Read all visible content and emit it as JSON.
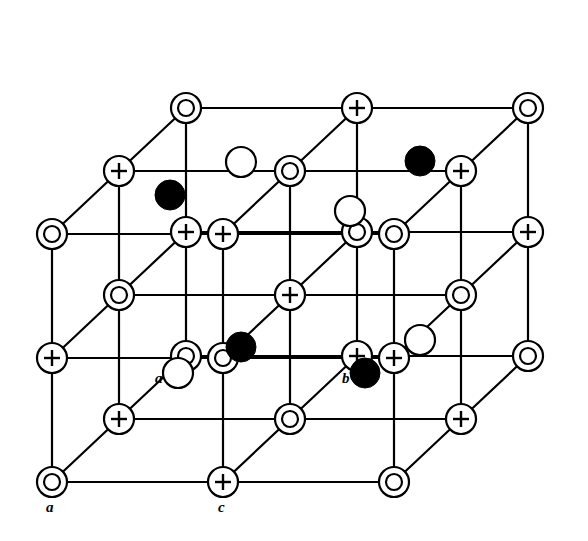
{
  "figure": {
    "background_color": "#ffffff",
    "line_color": "#000000",
    "fill_open": "#ffffff",
    "fill_solid": "#000000",
    "stroke_width": 2.2
  },
  "legend_symbols": [
    {
      "name": "double-circle-site",
      "glyph": "concentric-circles",
      "meaning": "anion lattice site",
      "outer_radius": 15,
      "inner_radius": 8
    },
    {
      "name": "plus-circle-site",
      "glyph": "circle-with-plus",
      "meaning": "cation lattice site",
      "radius": 15
    },
    {
      "name": "open-circle-atom",
      "glyph": "plain-open-circle",
      "meaning": "interstitial atom, front layer",
      "radius": 15
    },
    {
      "name": "filled-circle-atom",
      "glyph": "solid-black-circle",
      "meaning": "interstitial atom, rear layer",
      "radius": 15
    }
  ],
  "labels": [
    {
      "id": "axis-a",
      "text": "a",
      "x": 46,
      "y": 500
    },
    {
      "id": "axis-c",
      "text": "c",
      "x": 218,
      "y": 500
    },
    {
      "id": "site-a",
      "text": "a",
      "x": 155,
      "y": 371
    },
    {
      "id": "site-b",
      "text": "b",
      "x": 342,
      "y": 371
    }
  ],
  "geometry": {
    "note": "Oblique projection. Front face grid uses x-step and y-step; depth offset shifts up-right.",
    "front_origin_x": 52,
    "front_origin_y": 482,
    "x_step": 171,
    "y_step": 124,
    "depth_dx": 67,
    "depth_dy": -63,
    "layers": 3,
    "cols": 3,
    "rows": 3
  },
  "lattice_sites": [
    {
      "id": "L0-r0-c0",
      "type": "double-circle-site",
      "x": 52,
      "y": 482
    },
    {
      "id": "L0-r0-c1",
      "type": "plus-circle-site",
      "x": 223,
      "y": 482
    },
    {
      "id": "L0-r0-c2",
      "type": "double-circle-site",
      "x": 394,
      "y": 482
    },
    {
      "id": "L0-r1-c0",
      "type": "plus-circle-site",
      "x": 52,
      "y": 358
    },
    {
      "id": "L0-r1-c1",
      "type": "double-circle-site",
      "x": 223,
      "y": 358
    },
    {
      "id": "L0-r1-c2",
      "type": "plus-circle-site",
      "x": 394,
      "y": 358
    },
    {
      "id": "L0-r2-c0",
      "type": "double-circle-site",
      "x": 52,
      "y": 234
    },
    {
      "id": "L0-r2-c1",
      "type": "plus-circle-site",
      "x": 223,
      "y": 234
    },
    {
      "id": "L0-r2-c2",
      "type": "double-circle-site",
      "x": 394,
      "y": 234
    },
    {
      "id": "L1-r0-c0",
      "type": "plus-circle-site",
      "x": 119,
      "y": 419
    },
    {
      "id": "L1-r0-c1",
      "type": "double-circle-site",
      "x": 290,
      "y": 419
    },
    {
      "id": "L1-r0-c2",
      "type": "plus-circle-site",
      "x": 461,
      "y": 419
    },
    {
      "id": "L1-r1-c0",
      "type": "double-circle-site",
      "x": 119,
      "y": 295
    },
    {
      "id": "L1-r1-c1",
      "type": "plus-circle-site",
      "x": 290,
      "y": 295
    },
    {
      "id": "L1-r1-c2",
      "type": "double-circle-site",
      "x": 461,
      "y": 295
    },
    {
      "id": "L1-r2-c0",
      "type": "plus-circle-site",
      "x": 119,
      "y": 171
    },
    {
      "id": "L1-r2-c1",
      "type": "double-circle-site",
      "x": 290,
      "y": 171
    },
    {
      "id": "L1-r2-c2",
      "type": "plus-circle-site",
      "x": 461,
      "y": 171
    },
    {
      "id": "L2-r0-c0",
      "type": "double-circle-site",
      "x": 186,
      "y": 356
    },
    {
      "id": "L2-r0-c1",
      "type": "plus-circle-site",
      "x": 357,
      "y": 356
    },
    {
      "id": "L2-r0-c2",
      "type": "double-circle-site",
      "x": 528,
      "y": 356
    },
    {
      "id": "L2-r1-c0",
      "type": "plus-circle-site",
      "x": 186,
      "y": 232
    },
    {
      "id": "L2-r1-c1",
      "type": "double-circle-site",
      "x": 357,
      "y": 232
    },
    {
      "id": "L2-r1-c2",
      "type": "plus-circle-site",
      "x": 528,
      "y": 232
    },
    {
      "id": "L2-r2-c0",
      "type": "double-circle-site",
      "x": 186,
      "y": 108
    },
    {
      "id": "L2-r2-c1",
      "type": "plus-circle-site",
      "x": 357,
      "y": 108
    },
    {
      "id": "L2-r2-c2",
      "type": "double-circle-site",
      "x": 528,
      "y": 108
    }
  ],
  "interstitial_atoms": [
    {
      "id": "open-1",
      "type": "open-circle-atom",
      "x": 241,
      "y": 162,
      "radius": 15
    },
    {
      "id": "filled-1",
      "type": "filled-circle-atom",
      "x": 170,
      "y": 195,
      "radius": 15
    },
    {
      "id": "filled-2",
      "type": "filled-circle-atom",
      "x": 420,
      "y": 161,
      "radius": 15
    },
    {
      "id": "open-2",
      "type": "open-circle-atom",
      "x": 350,
      "y": 211,
      "radius": 15
    },
    {
      "id": "filled-3",
      "type": "filled-circle-atom",
      "x": 241,
      "y": 347,
      "radius": 15
    },
    {
      "id": "open-3",
      "type": "open-circle-atom",
      "x": 420,
      "y": 340,
      "radius": 15
    },
    {
      "id": "open-4",
      "type": "open-circle-atom",
      "x": 178,
      "y": 373,
      "radius": 15
    },
    {
      "id": "filled-4",
      "type": "filled-circle-atom",
      "x": 365,
      "y": 373,
      "radius": 15
    }
  ]
}
